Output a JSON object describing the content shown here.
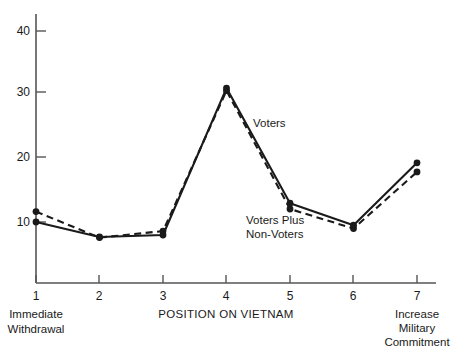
{
  "chart_data": {
    "type": "line",
    "title": "",
    "subtitle": "",
    "xlabel": "POSITION ON VIETNAM",
    "ylabel": "",
    "x": [
      1,
      2,
      3,
      4,
      5,
      6,
      7
    ],
    "categories": [
      "1",
      "2",
      "3",
      "4",
      "5",
      "6",
      "7"
    ],
    "xlim": [
      1,
      7
    ],
    "ylim": [
      0,
      43
    ],
    "yticks": [
      10,
      20,
      30,
      40
    ],
    "ytick_labels": [
      "10",
      "20",
      "30",
      "40"
    ],
    "xticks": [
      1,
      2,
      3,
      4,
      5,
      6,
      7
    ],
    "xtick_labels": [
      "1",
      "2",
      "3",
      "4",
      "5",
      "6",
      "7"
    ],
    "grid": false,
    "legend_position": "inline-annotation",
    "series": [
      {
        "name": "Voters",
        "style": "solid",
        "marker": "filled-circle",
        "color": "#1a1a1a",
        "values": [
          10.0,
          7.7,
          8.0,
          30.6,
          12.9,
          9.5,
          19.1
        ]
      },
      {
        "name": "Voters Plus Non-Voters",
        "style": "dashed",
        "marker": "filled-circle",
        "color": "#1a1a1a",
        "values": [
          11.6,
          7.6,
          8.6,
          30.2,
          12.0,
          9.0,
          17.7
        ]
      }
    ],
    "annotations": [
      {
        "text": "Voters",
        "series": "Voters",
        "x": 4.35,
        "y": 23.5
      },
      {
        "text": "Voters Plus",
        "series": "Voters Plus Non-Voters",
        "x": 4.1,
        "y": 13.2
      },
      {
        "text": "Non-Voters",
        "series": "Voters Plus Non-Voters",
        "x": 4.1,
        "y": 11.3
      }
    ],
    "axis_end_labels": {
      "left": [
        "Immediate",
        "Withdrawal"
      ],
      "right": [
        "Increase",
        "Military",
        "Commitment"
      ]
    }
  },
  "axis": {
    "x_title": "POSITION ON VIETNAM",
    "y_tick_10": "10",
    "y_tick_20": "20",
    "y_tick_30": "30",
    "y_tick_40": "40",
    "x_tick_1": "1",
    "x_tick_2": "2",
    "x_tick_3": "3",
    "x_tick_4": "4",
    "x_tick_5": "5",
    "x_tick_6": "6",
    "x_tick_7": "7"
  },
  "labels": {
    "left_line1": "Immediate",
    "left_line2": "Withdrawal",
    "right_line1": "Increase",
    "right_line2": "Military",
    "right_line3": "Commitment",
    "series_voters": "Voters",
    "series_voters_plus_line1": "Voters Plus",
    "series_voters_plus_line2": "Non-Voters"
  },
  "colors": {
    "ink": "#1a1a1a",
    "axis": "#555555",
    "background": "#ffffff"
  }
}
